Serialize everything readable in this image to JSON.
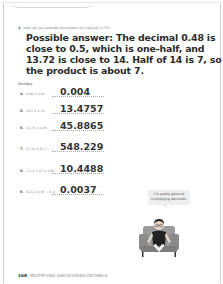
{
  "question3": {
    "number": "3.",
    "prompt": "How can you estimate the product of 0.48 and 13.72?",
    "answer": "Possible answer: The decimal 0.48 is close to 0.5, which is one-half, and 13.72 is close to 14. Half of 14 is 7, so the product is about 7."
  },
  "multiply": {
    "label": "Multiply.",
    "items": [
      {
        "number": "4.",
        "problem": "0.08 × 0.05",
        "answer": "0.004"
      },
      {
        "number": "5.",
        "problem": "2.07 × 6.51",
        "answer": "13.4757"
      },
      {
        "number": "6.",
        "problem": "11.33 × 4.05",
        "answer": "45.8865"
      },
      {
        "number": "7.",
        "problem": "67.10 × 8.17",
        "answer": "548.229"
      },
      {
        "number": "8.",
        "problem": "7.2 × 1.51 × 0.96",
        "answer": "10.4488"
      },
      {
        "number": "9.",
        "problem": "0.21 × 0.97 − 0.2",
        "answer": "0.0037"
      }
    ]
  },
  "speech_bubble": {
    "text": "I'm pretty good at multiplying decimals."
  },
  "illustration": {
    "icon": "student-in-armchair"
  },
  "footer": {
    "page_number": "168",
    "text": "MULTIPLYING AND DIVIDING DECIMALS"
  }
}
